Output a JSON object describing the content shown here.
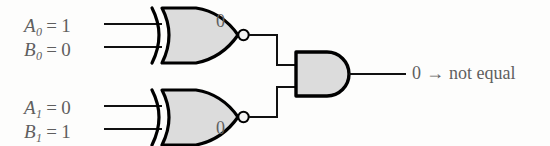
{
  "figure": {
    "background_color": "#fdfdfc",
    "ink_color": "#000000",
    "text_color": "#5f5f5f",
    "gate_fill_color": "#dcdcdc"
  },
  "inputs": [
    {
      "id": "a0",
      "var": "A",
      "sub": "0",
      "eq": "=",
      "value": "1",
      "full": "A0 = 1"
    },
    {
      "id": "b0",
      "var": "B",
      "sub": "0",
      "eq": "=",
      "value": "0",
      "full": "B0 = 0"
    },
    {
      "id": "a1",
      "var": "A",
      "sub": "1",
      "eq": "=",
      "value": "0",
      "full": "A1 = 0"
    },
    {
      "id": "b1",
      "var": "B",
      "sub": "1",
      "eq": "=",
      "value": "1",
      "full": "B1 = 1"
    }
  ],
  "gates": [
    {
      "id": "xnor0",
      "type": "XNOR",
      "output_value": "0"
    },
    {
      "id": "xnor1",
      "type": "XNOR",
      "output_value": "0"
    },
    {
      "id": "and0",
      "type": "AND",
      "output_value": "0"
    }
  ],
  "output": {
    "value": "0",
    "arrow": "→",
    "meaning": "not equal",
    "full": "0 → not equal"
  }
}
